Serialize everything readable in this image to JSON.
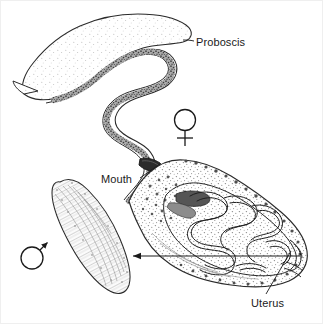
{
  "figure": {
    "background_color": "#ffffff",
    "ink_color": "#1a1a1a",
    "stipple_color": "#6f6f6f"
  },
  "labels": [
    {
      "id": "proboscis",
      "text": "Proboscis",
      "x": 196,
      "y": 36,
      "target": "anterior sinuous tube"
    },
    {
      "id": "mouth",
      "text": "Mouth",
      "x": 101,
      "y": 173,
      "target": "dark structure at proboscis base"
    },
    {
      "id": "uterus",
      "text": "Uterus",
      "x": 251,
      "y": 297,
      "target": "coiled tube inside posterior body"
    }
  ],
  "symbols": [
    {
      "id": "female",
      "glyph": "female-symbol",
      "unicode": "♀",
      "x": 185,
      "y": 128,
      "meaning": "female specimen"
    },
    {
      "id": "male",
      "glyph": "male-symbol",
      "unicode": "♂",
      "x": 32,
      "y": 258,
      "meaning": "male specimen"
    }
  ],
  "specimens": [
    {
      "id": "female-worm",
      "sex": "female",
      "parts": [
        "proboscis",
        "mouth",
        "body",
        "uterus"
      ]
    },
    {
      "id": "male-worm",
      "sex": "male",
      "parts": [
        "body"
      ]
    }
  ],
  "connectors": [
    {
      "id": "proboscis-leader",
      "from": [
        196,
        42
      ],
      "to": [
        183,
        40
      ]
    },
    {
      "id": "mouth-leader",
      "from": [
        140,
        179
      ],
      "to": [
        158,
        166
      ]
    },
    {
      "id": "uterus-leader",
      "from": [
        266,
        295
      ],
      "to": [
        290,
        252
      ]
    },
    {
      "id": "male-comparison-arrow",
      "from": [
        300,
        256
      ],
      "to": [
        131,
        256
      ],
      "arrowhead": "left"
    },
    {
      "id": "male-symbol-arrow",
      "from": [
        40,
        250
      ],
      "to": [
        49,
        240
      ],
      "arrowhead": "up-right"
    }
  ]
}
